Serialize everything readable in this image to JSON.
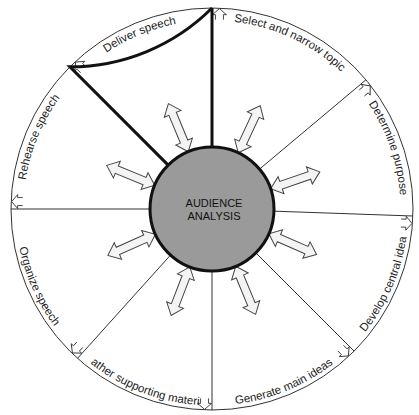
{
  "diagram": {
    "center": {
      "lines": [
        "AUDIENCE",
        "ANALYSIS"
      ],
      "fill": "#9a9a9a"
    },
    "steps": [
      {
        "id": "select",
        "label": "Select and narrow topic",
        "fill": "#9c9c9c"
      },
      {
        "id": "purpose",
        "label": "Determine purpose",
        "fill": "#c4c4c4"
      },
      {
        "id": "central-idea",
        "label": "Develop central idea",
        "fill": "#6e6e6e"
      },
      {
        "id": "main-ideas",
        "label": "Generate main ideas",
        "fill": "#7c7c7c"
      },
      {
        "id": "supporting",
        "label": "Gather supporting material",
        "fill": "#b2b2b2"
      },
      {
        "id": "organize",
        "label": "Organize speech",
        "fill": "#bcbcbc"
      },
      {
        "id": "rehearse",
        "label": "Rehearse speech",
        "fill": "#8c8c8c"
      },
      {
        "id": "deliver",
        "label": "Deliver speech",
        "fill": "#a0a0a0"
      }
    ],
    "highlighted_step": "deliver",
    "colors": {
      "ring": "#ffffff",
      "outline": "#333333",
      "highlight_outline": "#111111",
      "arrow_fill": "#f4f4f4",
      "arrow_stroke": "#444444"
    }
  }
}
